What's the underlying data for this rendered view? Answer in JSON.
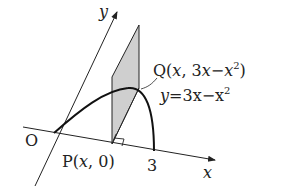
{
  "diagram": {
    "axes": {
      "x_label": "x",
      "y_label": "y",
      "origin_label": "O"
    },
    "points": {
      "P": {
        "name": "P",
        "coords": "(x, 0)"
      },
      "Q": {
        "name": "Q",
        "coords": "(x, 3x−x²)"
      },
      "three": "3"
    },
    "curve": {
      "equation_lhs": "y",
      "equation_rhs": "=3x−x",
      "equation_exp": "2"
    },
    "q_label": {
      "prefix": "Q(",
      "x": "x",
      "sep": ", 3",
      "x2": "x",
      "minus": "−",
      "x3": "x",
      "exp": "2",
      "suffix": ")"
    },
    "p_label": {
      "prefix": "P(",
      "x": "x",
      "suffix": ", 0)"
    },
    "colors": {
      "line": "#222222",
      "shade": "#cfcfcf"
    }
  }
}
